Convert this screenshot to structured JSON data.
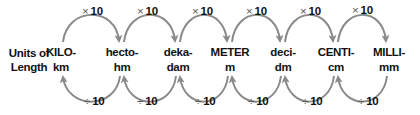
{
  "caption": {
    "line1": "Units of",
    "line2": "Length"
  },
  "units": [
    {
      "prefix": "KILO-",
      "symbol": "km",
      "x": 61
    },
    {
      "prefix": "hecto-",
      "symbol": "hm",
      "x": 122
    },
    {
      "prefix": "deka-",
      "symbol": "dam",
      "x": 178
    },
    {
      "prefix": "METER",
      "symbol": "m",
      "x": 230
    },
    {
      "prefix": "deci-",
      "symbol": "dm",
      "x": 283
    },
    {
      "prefix": "CENTI-",
      "symbol": "cm",
      "x": 336
    },
    {
      "prefix": "MILLI-",
      "symbol": "mm",
      "x": 389
    }
  ],
  "multiply": {
    "symbol": "×",
    "value": "10"
  },
  "divide": {
    "symbol": "÷",
    "value": "10"
  },
  "colors": {
    "arrow": "#8a8a8a",
    "text": "#111111"
  }
}
